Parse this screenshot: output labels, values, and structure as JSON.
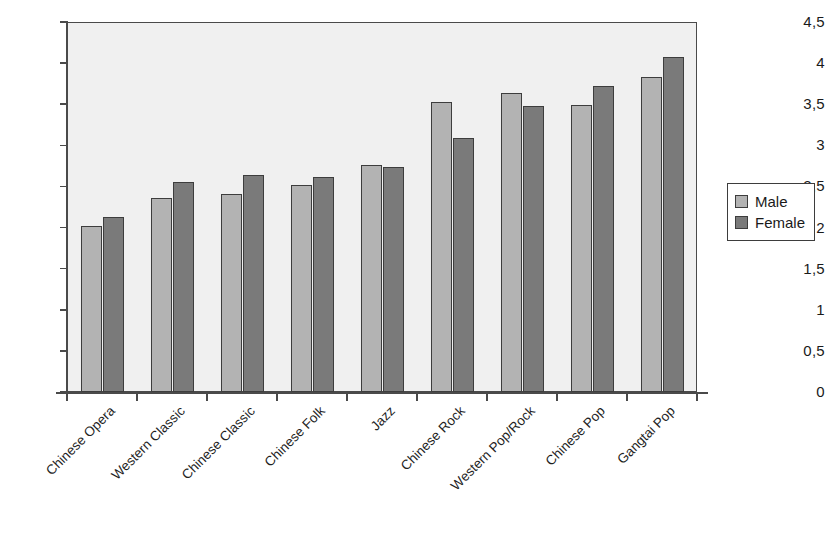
{
  "chart_data": {
    "type": "bar",
    "title": "",
    "subtitle": "",
    "xlabel": "",
    "ylabel": "",
    "ylim": [
      0,
      4.5
    ],
    "ytick_labels": [
      "0",
      "0,5",
      "1",
      "1,5",
      "2",
      "2,5",
      "3",
      "3,5",
      "4",
      "4,5"
    ],
    "ytick_values": [
      0,
      0.5,
      1,
      1.5,
      2,
      2.5,
      3,
      3.5,
      4,
      4.5
    ],
    "grid": false,
    "legend_position": "right",
    "decimal_separator": ",",
    "categories": [
      "Chinese Opera",
      "Western Classic",
      "Chinese Classic",
      "Chinese Folk",
      "Jazz",
      "Chinese Rock",
      "Western Pop/Rock",
      "Chinese Pop",
      "Gangtai Pop"
    ],
    "series": [
      {
        "name": "Male",
        "color": "#b3b3b3",
        "values": [
          2.02,
          2.36,
          2.41,
          2.52,
          2.76,
          3.53,
          3.64,
          3.49,
          3.83
        ]
      },
      {
        "name": "Female",
        "color": "#7a7a7a",
        "values": [
          2.13,
          2.56,
          2.64,
          2.61,
          2.74,
          3.09,
          3.48,
          3.72,
          4.08
        ]
      }
    ]
  },
  "legend": {
    "entries": [
      {
        "label": "Male",
        "swatch": "male-swatch"
      },
      {
        "label": "Female",
        "swatch": "female-swatch"
      }
    ]
  },
  "colors": {
    "male_bar": "#b3b3b3",
    "female_bar": "#7a7a7a",
    "plot_background": "#f0f0f0",
    "axis": "#4a4a4a",
    "bar_outline": "#3d3d3d",
    "text": "#1a1a1a"
  }
}
